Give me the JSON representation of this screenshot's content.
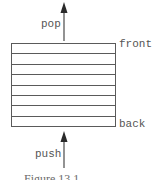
{
  "diagram": {
    "type": "queue-stack-illustration",
    "rows": 8,
    "labels": {
      "top_arrow": "pop",
      "bottom_arrow": "push",
      "top_side": "front",
      "bottom_side": "back"
    },
    "arrows": [
      {
        "name": "pop-arrow",
        "direction": "up",
        "position": "above-box"
      },
      {
        "name": "push-arrow",
        "direction": "up",
        "position": "below-box"
      }
    ],
    "caption": "Figure 13.1 ..."
  },
  "colors": {
    "line": "#5a5a5a",
    "text": "#555555",
    "background": "#ffffff"
  }
}
